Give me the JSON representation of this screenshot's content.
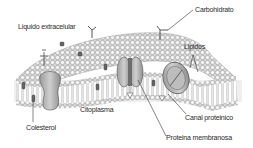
{
  "diagram": {
    "colors": {
      "lipid_head_fill": "#f4f4f4",
      "lipid_head_stroke": "#8a8a8a",
      "lipid_tail": "#9a9a9a",
      "protein_fill": "#b5b5b5",
      "protein_stroke": "#555555",
      "cytoplasm_band": "#efefef",
      "leader_line": "#333333",
      "text": "#2a2a2a"
    },
    "labels": {
      "extracellular": "Liquido extracelular",
      "carbohydrate": "Carbohidrato",
      "lipids": "Lipidos",
      "cytoplasm": "Citoplasma",
      "cholesterol": "Colesterol",
      "protein_channel": "Canal proteinico",
      "membrane_protein": "Proteina membranosa"
    }
  }
}
